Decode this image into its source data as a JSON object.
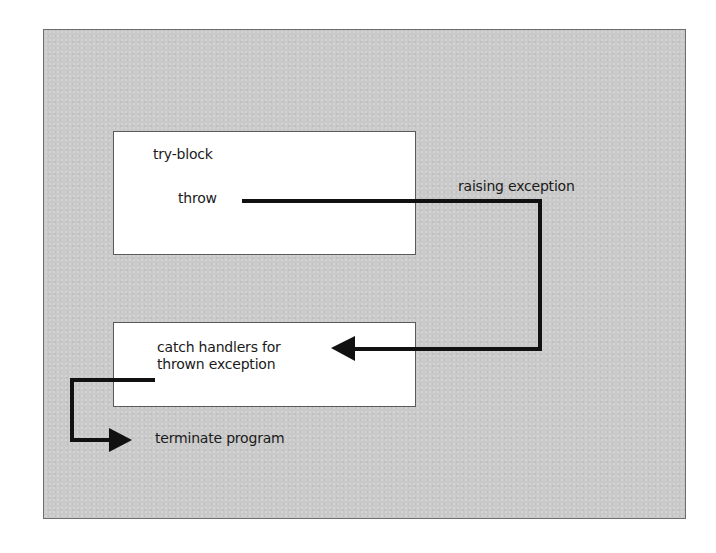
{
  "diagram": {
    "nodes": {
      "try_block": {
        "label": "try-block",
        "statement": "throw"
      },
      "catch_block": {
        "label": "catch handlers for thrown exception"
      },
      "terminate": {
        "label": "terminate program"
      }
    },
    "edges": [
      {
        "from": "throw",
        "to": "catch_block",
        "label": "raising exception"
      },
      {
        "from": "catch_block",
        "to": "terminate",
        "label": ""
      }
    ],
    "colors": {
      "panel_background": "#c9c9c9",
      "box_background": "#ffffff",
      "arrow": "#111111",
      "text": "#1a1a1a"
    }
  }
}
